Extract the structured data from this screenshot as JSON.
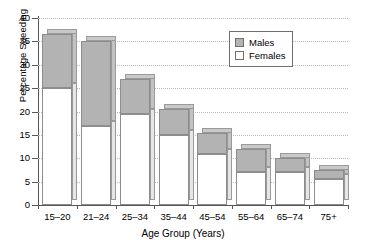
{
  "chart_data": {
    "type": "bar",
    "subtype": "stacked-vertical",
    "title": "",
    "xlabel": "Age Group (Years)",
    "ylabel": "Percentage Speeding",
    "categories": [
      "15–20",
      "21–24",
      "25–34",
      "35–44",
      "45–54",
      "55–64",
      "65–74",
      "75+"
    ],
    "series": [
      {
        "name": "Females",
        "color": "#ffffff",
        "values": [
          25,
          17,
          19.5,
          15,
          11,
          7,
          7,
          5.5
        ]
      },
      {
        "name": "Males",
        "color": "#b3b3b3",
        "values": [
          11.5,
          18,
          7.5,
          5.5,
          4.5,
          5,
          3,
          2
        ]
      }
    ],
    "totals": [
      36.5,
      35,
      27,
      20.5,
      15.5,
      12,
      10,
      7.5
    ],
    "ylim": [
      0,
      40
    ],
    "yticks": [
      "0",
      "5",
      "10",
      "15",
      "20",
      "25",
      "30",
      "35",
      "40"
    ],
    "ytick_values": [
      0,
      5,
      10,
      15,
      20,
      25,
      30,
      35,
      40
    ],
    "grid": "horizontal-dotted",
    "legend_position": "top-right",
    "legend": [
      "Males",
      "Females"
    ]
  },
  "legend": {
    "males_label": "Males",
    "females_label": "Females"
  },
  "axes": {
    "x_title": "Age Group (Years)",
    "y_title": "Percentage Speeding"
  }
}
